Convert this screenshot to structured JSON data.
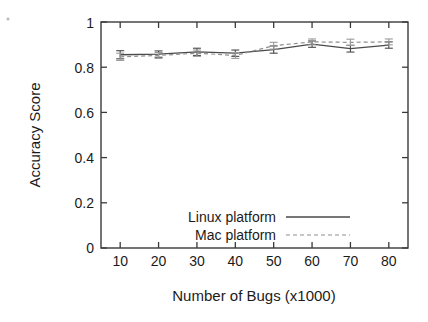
{
  "chart_data": {
    "type": "line",
    "title": "",
    "xlabel": "Number of Bugs (x1000)",
    "ylabel": "Accuracy Score",
    "x": [
      10,
      20,
      30,
      40,
      50,
      60,
      70,
      80
    ],
    "xlim": [
      5,
      85
    ],
    "ylim": [
      0,
      1
    ],
    "xticks": [
      10,
      20,
      30,
      40,
      50,
      60,
      70,
      80
    ],
    "xtick_labels": [
      "10",
      "20",
      "30",
      "40",
      "50",
      "60",
      "70",
      "80"
    ],
    "yticks": [
      0,
      0.2,
      0.4,
      0.6,
      0.8,
      1
    ],
    "ytick_labels": [
      "0",
      "0.2",
      "0.4",
      "0.6",
      "0.8",
      "1"
    ],
    "grid": false,
    "legend_position": "lower-center-inside",
    "series": [
      {
        "name": "Linux platform",
        "style": "solid",
        "color": "#4a4a4a",
        "values": [
          0.855,
          0.858,
          0.868,
          0.862,
          0.878,
          0.902,
          0.882,
          0.898
        ],
        "error": [
          0.018,
          0.014,
          0.016,
          0.014,
          0.016,
          0.014,
          0.015,
          0.014
        ]
      },
      {
        "name": "Mac platform",
        "style": "dashed",
        "color": "#9a9a9a",
        "values": [
          0.846,
          0.852,
          0.862,
          0.852,
          0.895,
          0.912,
          0.91,
          0.912
        ],
        "error": [
          0.016,
          0.013,
          0.014,
          0.013,
          0.015,
          0.013,
          0.014,
          0.013
        ]
      }
    ]
  },
  "legend": {
    "items": [
      {
        "label": "Linux platform",
        "style": "solid"
      },
      {
        "label": "Mac platform",
        "style": "dashed"
      }
    ]
  },
  "axes": {
    "y_title": "Accuracy Score",
    "x_title": "Number of Bugs (x1000)"
  }
}
